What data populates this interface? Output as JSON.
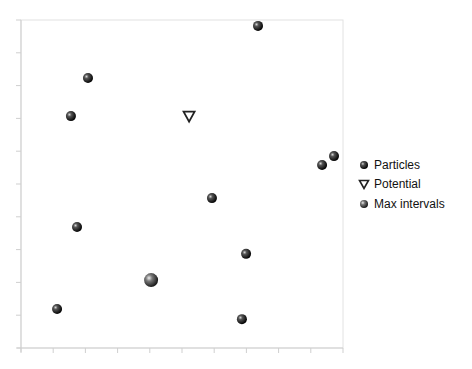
{
  "chart_data": {
    "type": "scatter",
    "title": "",
    "xlabel": "",
    "ylabel": "",
    "xlim": [
      0,
      10
    ],
    "ylim": [
      0,
      10
    ],
    "x_ticks": [
      0,
      1,
      2,
      3,
      4,
      5,
      6,
      7,
      8,
      9,
      10
    ],
    "y_ticks": [
      0,
      1,
      2,
      3,
      4,
      5,
      6,
      7,
      8,
      9,
      10
    ],
    "tick_labels_visible": false,
    "grid": false,
    "legend_position": "right",
    "series": [
      {
        "name": "Particles",
        "marker": "sphere",
        "color": "#1a1a1a",
        "points": [
          {
            "x": 7.36,
            "y": 9.82
          },
          {
            "x": 2.08,
            "y": 8.23
          },
          {
            "x": 1.55,
            "y": 7.07
          },
          {
            "x": 9.72,
            "y": 5.85
          },
          {
            "x": 9.35,
            "y": 5.58
          },
          {
            "x": 5.93,
            "y": 4.57
          },
          {
            "x": 1.74,
            "y": 3.69
          },
          {
            "x": 6.99,
            "y": 2.87
          },
          {
            "x": 1.12,
            "y": 1.19
          },
          {
            "x": 6.86,
            "y": 0.88
          }
        ]
      },
      {
        "name": "Potential",
        "marker": "triangle-down",
        "color": "#222222",
        "points": [
          {
            "x": 5.22,
            "y": 7.07
          }
        ]
      },
      {
        "name": "Max intervals",
        "marker": "sphere-large",
        "color": "#555555",
        "points": [
          {
            "x": 4.04,
            "y": 2.07
          }
        ]
      }
    ]
  },
  "legend": {
    "items": [
      {
        "label": "Particles"
      },
      {
        "label": "Potential"
      },
      {
        "label": "Max intervals"
      }
    ]
  }
}
